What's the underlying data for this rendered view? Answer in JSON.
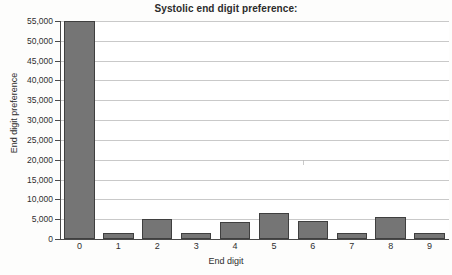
{
  "chart_data": {
    "type": "bar",
    "title": "Systolic end digit preference:",
    "xlabel": "End digit",
    "ylabel": "End digit preference",
    "categories": [
      "0",
      "1",
      "2",
      "3",
      "4",
      "5",
      "6",
      "7",
      "8",
      "9"
    ],
    "values": [
      55000,
      1400,
      5000,
      1500,
      4400,
      6600,
      4600,
      1600,
      5600,
      1500
    ],
    "ylim": [
      0,
      55000
    ],
    "ytick_labels": [
      "55,000",
      "50,000",
      "45,000",
      "40,000",
      "35,000",
      "30,000",
      "25,000",
      "20,000",
      "15,000",
      "10,000",
      "5,000",
      "0"
    ],
    "ytick_values": [
      55000,
      50000,
      45000,
      40000,
      35000,
      30000,
      25000,
      20000,
      15000,
      10000,
      5000,
      0
    ],
    "grid": true,
    "legend": "none",
    "colors": {
      "bar_fill": "#757575",
      "bar_stroke": "#3f3f3f",
      "gridline": "#c9c9c9",
      "axis": "#4a4a4a",
      "text": "#2f2f2f",
      "background": "#ffffff"
    }
  }
}
